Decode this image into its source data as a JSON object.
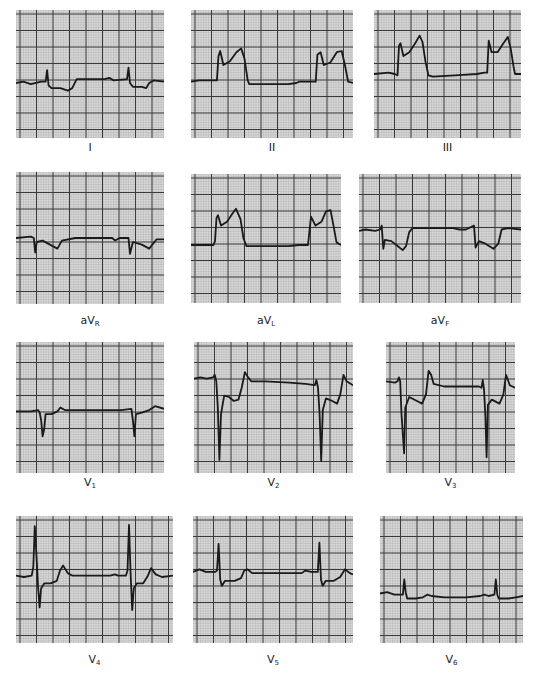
{
  "figure": {
    "type": "12-lead ECG",
    "colors": {
      "paper": "#d8d8d8",
      "minor_grid": "#b4b4b4",
      "major_grid": "#3a3a3a",
      "trace": "#1a1a1a",
      "background": "#ffffff"
    },
    "leads": [
      {
        "id": "I",
        "prefix": "",
        "main": "I",
        "sub": "",
        "x": 16,
        "y": 10,
        "w": 148,
        "h": 128,
        "label_y": 141,
        "baseline": 0.55,
        "path": "M0,0.57 L0.05,0.56 L0.1,0.58 L0.17,0.56 L0.2,0.56 L0.21,0.47 L0.22,0.59 L0.24,0.61 L0.3,0.61 L0.35,0.63 L0.38,0.61 L0.41,0.54 L0.5,0.54 L0.6,0.54 L0.63,0.53 L0.66,0.55 L0.75,0.54 L0.76,0.45 L0.77,0.57 L0.79,0.6 L0.85,0.6 L0.88,0.61 L0.9,0.57 L0.93,0.55 L1,0.56"
      },
      {
        "id": "II",
        "prefix": "",
        "main": "II",
        "sub": "",
        "x": 191,
        "y": 10,
        "w": 162,
        "h": 128,
        "label_y": 141,
        "path": "M0,0.56 L0.05,0.55 L0.16,0.55 L0.17,0.36 L0.18,0.32 L0.2,0.43 L0.24,0.4 L0.28,0.33 L0.31,0.3 L0.33,0.38 L0.35,0.55 L0.36,0.58 L0.45,0.58 L0.6,0.58 L0.65,0.57 L0.67,0.56 L0.77,0.56 L0.78,0.35 L0.8,0.33 L0.82,0.43 L0.86,0.41 L0.9,0.33 L0.93,0.32 L0.95,0.43 L0.97,0.56 L1,0.57"
      },
      {
        "id": "III",
        "prefix": "",
        "main": "III",
        "sub": "",
        "x": 374,
        "y": 10,
        "w": 147,
        "h": 128,
        "label_y": 141,
        "path": "M0,0.5 L0.1,0.49 L0.14,0.5 L0.16,0.51 L0.17,0.28 L0.18,0.26 L0.2,0.36 L0.24,0.33 L0.28,0.26 L0.31,0.2 L0.33,0.25 L0.35,0.4 L0.37,0.51 L0.4,0.52 L0.55,0.51 L0.7,0.5 L0.75,0.49 L0.77,0.49 L0.78,0.24 L0.8,0.33 L0.84,0.33 L0.88,0.26 L0.91,0.21 L0.93,0.3 L0.95,0.45 L0.96,0.5 L1,0.5"
      },
      {
        "id": "aVR",
        "prefix": "a",
        "main": "V",
        "sub": "R",
        "x": 16,
        "y": 172,
        "w": 148,
        "h": 132,
        "label_y": 314,
        "path": "M0,0.5 L0.1,0.49 L0.12,0.5 L0.13,0.61 L0.14,0.53 L0.18,0.52 L0.23,0.55 L0.28,0.58 L0.31,0.52 L0.4,0.5 L0.6,0.5 L0.65,0.5 L0.67,0.52 L0.7,0.5 L0.76,0.5 L0.77,0.62 L0.79,0.53 L0.85,0.55 L0.9,0.58 L0.95,0.51 L1,0.51"
      },
      {
        "id": "aVL",
        "prefix": "a",
        "main": "V",
        "sub": "L",
        "x": 191,
        "y": 174,
        "w": 150,
        "h": 129,
        "label_y": 314,
        "path": "M0,0.55 L0.15,0.55 L0.16,0.52 L0.17,0.34 L0.18,0.32 L0.2,0.4 L0.24,0.37 L0.28,0.3 L0.3,0.27 L0.33,0.35 L0.35,0.5 L0.37,0.56 L0.5,0.56 L0.65,0.56 L0.72,0.55 L0.78,0.55 L0.8,0.33 L0.83,0.4 L0.87,0.37 L0.9,0.29 L0.93,0.28 L0.95,0.4 L0.97,0.53 L1,0.55"
      },
      {
        "id": "aVF",
        "prefix": "a",
        "main": "V",
        "sub": "F",
        "x": 359,
        "y": 174,
        "w": 162,
        "h": 129,
        "label_y": 314,
        "path": "M0,0.44 L0.04,0.43 L0.1,0.44 L0.13,0.43 L0.14,0.4 L0.15,0.58 L0.16,0.51 L0.2,0.52 L0.24,0.56 L0.27,0.59 L0.29,0.56 L0.31,0.45 L0.33,0.42 L0.45,0.42 L0.58,0.42 L0.62,0.43 L0.66,0.43 L0.71,0.4 L0.72,0.57 L0.74,0.52 L0.78,0.54 L0.83,0.58 L0.86,0.54 L0.88,0.43 L0.92,0.42 L1,0.43"
      },
      {
        "id": "V1",
        "prefix": "",
        "main": "V",
        "sub": "1",
        "x": 16,
        "y": 342,
        "w": 148,
        "h": 131,
        "label_y": 476,
        "path": "M0,0.53 L0.1,0.53 L0.15,0.52 L0.16,0.54 L0.17,0.6 L0.18,0.72 L0.19,0.67 L0.2,0.55 L0.24,0.55 L0.28,0.53 L0.3,0.5 L0.33,0.52 L0.4,0.52 L0.6,0.52 L0.68,0.52 L0.71,0.52 L0.78,0.51 L0.79,0.6 L0.8,0.72 L0.81,0.55 L0.85,0.54 L0.9,0.52 L0.94,0.49 L1,0.51"
      },
      {
        "id": "V2",
        "prefix": "",
        "main": "V",
        "sub": "2",
        "x": 194,
        "y": 342,
        "w": 159,
        "h": 131,
        "label_y": 476,
        "path": "M0,0.28 L0.04,0.27 L0.08,0.28 L0.12,0.27 L0.13,0.25 L0.14,0.3 L0.15,0.5 L0.16,0.9 L0.17,0.55 L0.19,0.41 L0.22,0.42 L0.25,0.45 L0.28,0.44 L0.3,0.35 L0.32,0.23 L0.34,0.27 L0.36,0.3 L0.45,0.3 L0.6,0.31 L0.7,0.32 L0.76,0.33 L0.77,0.29 L0.78,0.35 L0.79,0.55 L0.8,0.91 L0.81,0.52 L0.83,0.43 L0.87,0.45 L0.9,0.47 L0.92,0.4 L0.94,0.25 L0.96,0.3 L1,0.33"
      },
      {
        "id": "V3",
        "prefix": "",
        "main": "V",
        "sub": "3",
        "x": 386,
        "y": 342,
        "w": 129,
        "h": 131,
        "label_y": 476,
        "path": "M0,0.3 L0.07,0.31 L0.09,0.3 L0.1,0.27 L0.11,0.3 L0.12,0.55 L0.14,0.85 L0.15,0.5 L0.18,0.42 L0.24,0.45 L0.28,0.47 L0.31,0.4 L0.33,0.22 L0.35,0.25 L0.37,0.32 L0.45,0.34 L0.6,0.34 L0.7,0.34 L0.72,0.34 L0.74,0.35 L0.75,0.29 L0.76,0.36 L0.77,0.55 L0.78,0.88 L0.79,0.48 L0.82,0.44 L0.88,0.47 L0.91,0.4 L0.93,0.25 L0.96,0.33 L1,0.35"
      },
      {
        "id": "V4",
        "prefix": "",
        "main": "V",
        "sub": "4",
        "x": 16,
        "y": 516,
        "w": 157,
        "h": 127,
        "label_y": 653,
        "path": "M0,0.47 L0.05,0.48 L0.1,0.47 L0.11,0.4 L0.12,0.08 L0.13,0.3 L0.14,0.55 L0.15,0.72 L0.16,0.57 L0.18,0.53 L0.22,0.53 L0.26,0.51 L0.28,0.43 L0.3,0.39 L0.33,0.45 L0.36,0.47 L0.45,0.47 L0.6,0.47 L0.63,0.46 L0.65,0.47 L0.7,0.47 L0.71,0.43 L0.72,0.07 L0.73,0.45 L0.74,0.74 L0.75,0.57 L0.77,0.53 L0.81,0.53 L0.84,0.47 L0.86,0.41 L0.89,0.46 L0.93,0.48 L1,0.47"
      },
      {
        "id": "V5",
        "prefix": "",
        "main": "V",
        "sub": "5",
        "x": 193,
        "y": 516,
        "w": 160,
        "h": 127,
        "label_y": 653,
        "path": "M0,0.44 L0.04,0.42 L0.08,0.44 L0.14,0.44 L0.15,0.43 L0.16,0.22 L0.17,0.5 L0.18,0.55 L0.2,0.51 L0.26,0.51 L0.3,0.49 L0.32,0.43 L0.34,0.42 L0.37,0.45 L0.45,0.45 L0.6,0.45 L0.68,0.45 L0.7,0.43 L0.74,0.44 L0.78,0.44 L0.79,0.21 L0.8,0.5 L0.81,0.55 L0.83,0.51 L0.88,0.51 L0.92,0.48 L0.95,0.42 L0.98,0.45 L1,0.46"
      },
      {
        "id": "V6",
        "prefix": "",
        "main": "V",
        "sub": "6",
        "x": 380,
        "y": 516,
        "w": 143,
        "h": 127,
        "label_y": 653,
        "path": "M0,0.61 L0.05,0.6 L0.1,0.62 L0.16,0.62 L0.17,0.5 L0.18,0.6 L0.19,0.65 L0.25,0.65 L0.3,0.64 L0.33,0.62 L0.36,0.63 L0.45,0.64 L0.6,0.64 L0.7,0.63 L0.73,0.62 L0.76,0.63 L0.8,0.62 L0.81,0.5 L0.82,0.62 L0.83,0.65 L0.9,0.65 L0.95,0.64 L1,0.63"
      }
    ]
  }
}
